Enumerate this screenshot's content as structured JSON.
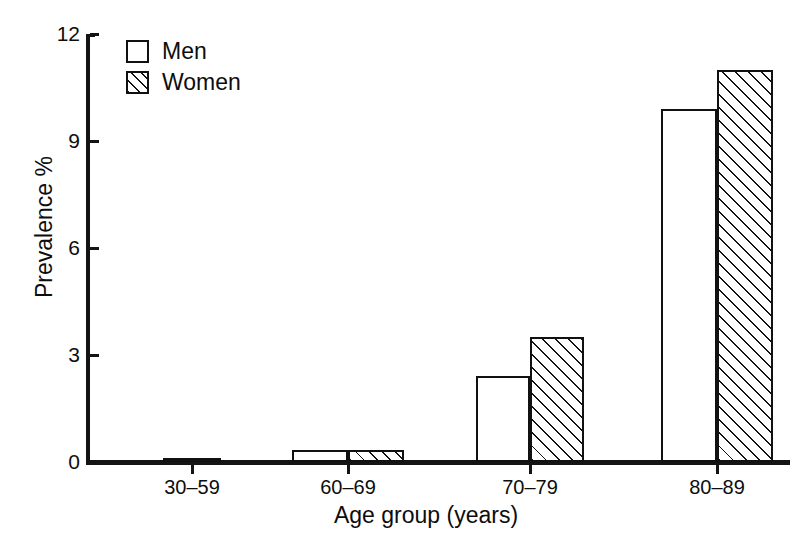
{
  "chart_data": {
    "type": "bar",
    "title": "",
    "subtitle": "",
    "xlabel": "Age group (years)",
    "ylabel": "Prevalence %",
    "categories": [
      "30–59",
      "60–69",
      "70–79",
      "80–89"
    ],
    "series": [
      {
        "name": "Men",
        "values": [
          0.1,
          0.35,
          2.4,
          9.9
        ]
      },
      {
        "name": "Women",
        "values": [
          0.1,
          0.35,
          3.5,
          11.0
        ]
      }
    ],
    "ylim": [
      0,
      12
    ],
    "yticks": [
      "0",
      "3",
      "6",
      "9",
      "12"
    ],
    "ytick_values": [
      0,
      3,
      6,
      9,
      12
    ],
    "grid": false,
    "legend_position": "top-left",
    "legend": [
      {
        "label": "Men",
        "swatch": "white-square"
      },
      {
        "label": "Women",
        "swatch": "hatched-square"
      }
    ],
    "colors": {
      "men_fill": "#ffffff",
      "women_fill": "#ffffff",
      "women_hatch": "#141414",
      "outline": "#111111",
      "axis": "#141414",
      "text": "#0d0d0d",
      "background": "#ffffff"
    }
  }
}
